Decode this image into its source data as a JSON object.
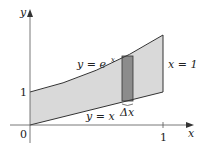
{
  "figure": {
    "axes": {
      "x_label": "x",
      "y_label": "y",
      "origin_label": "0",
      "x_tick_label": "1",
      "y_tick_label": "1"
    },
    "curves": {
      "upper_label": "y = e",
      "upper_exp": "x",
      "lower_label": "y = x",
      "right_bound_label": "x = 1"
    },
    "strip": {
      "label": "Δx"
    },
    "colors": {
      "region_fill": "#d9d9d9",
      "strip_fill": "#8c8c8c",
      "line": "#333333"
    }
  }
}
